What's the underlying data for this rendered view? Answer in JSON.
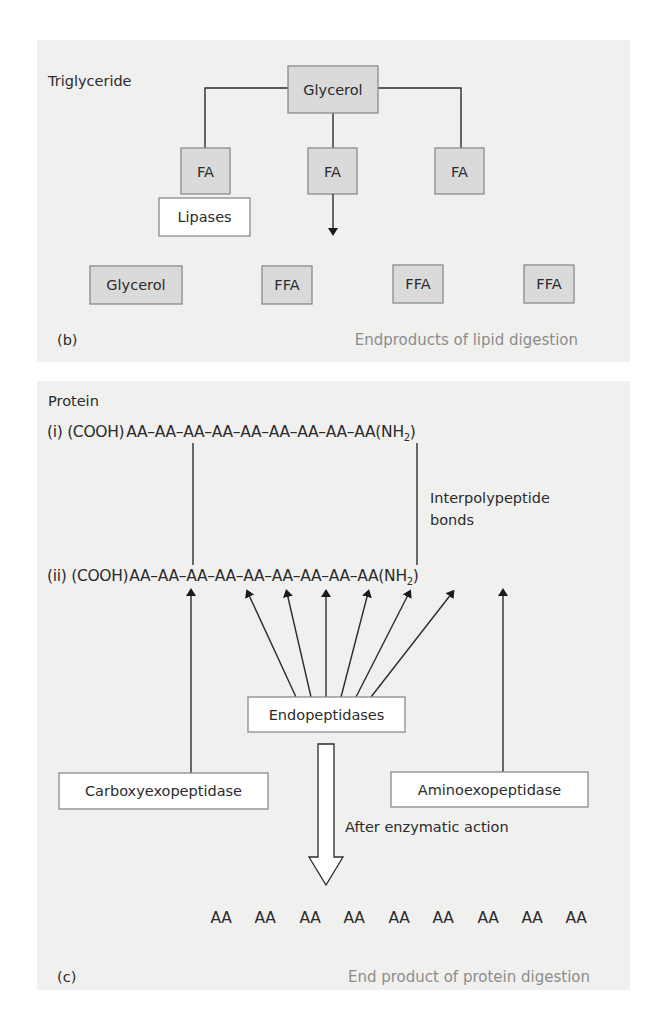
{
  "panel_b": {
    "title": "Triglyceride",
    "top_box": "Glycerol",
    "fatty_acids": [
      "FA",
      "FA",
      "FA"
    ],
    "enzyme": "Lipases",
    "products": [
      "Glycerol",
      "FFA",
      "FFA",
      "FFA"
    ],
    "panel_label": "(b)",
    "caption": "Endproducts of lipid digestion"
  },
  "panel_c": {
    "title": "Protein",
    "chain_i": {
      "prefix": "(i) (COOH)",
      "residues": [
        "AA",
        "AA",
        "AA",
        "AA",
        "AA",
        "AA",
        "AA",
        "AA",
        "AA"
      ],
      "suffix": "(NH",
      "subscript": "2",
      "close": ")"
    },
    "chain_ii": {
      "prefix": "(ii) (COOH)",
      "residues": [
        "AA",
        "AA",
        "AA",
        "AA",
        "AA",
        "AA",
        "AA",
        "AA",
        "AA"
      ],
      "suffix": "(NH",
      "subscript": "2",
      "close": ")"
    },
    "bond_label_line1": "Interpolypeptide",
    "bond_label_line2": "bonds",
    "endopeptidases": "Endopeptidases",
    "carboxyexopeptidase": "Carboxyexopeptidase",
    "aminoexopeptidase": "Aminoexopeptidase",
    "after_action": "After enzymatic action",
    "end_products": [
      "AA",
      "AA",
      "AA",
      "AA",
      "AA",
      "AA",
      "AA",
      "AA",
      "AA"
    ],
    "panel_label": "(c)",
    "caption": "End product of protein digestion"
  },
  "colors": {
    "panel_bg": "#f0f0ef",
    "box_grey": "#dadada",
    "box_border": "#8a8a8a",
    "caption": "#8c8c8c",
    "ink": "#2b2b2b"
  }
}
